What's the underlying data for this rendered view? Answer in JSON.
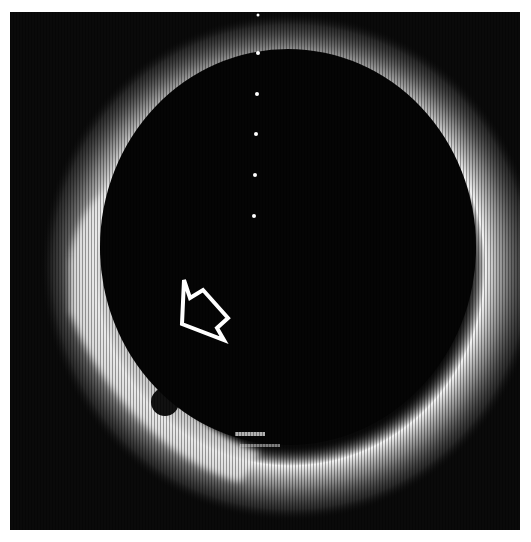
{
  "image": {
    "type": "ultrasound-scan",
    "description": "Circular ultrasound cross-section with a dark anechoic lumen surrounded by a bright echogenic ring; an outlined arrow points to a hypoechoic region at the lower-left wall",
    "annotation": {
      "kind": "outline-arrow",
      "color": "#ffffff",
      "pointing": "down-right"
    },
    "calibration_dots": 6,
    "colors": {
      "background": "#0a0a0a",
      "echo": "#ffffff",
      "border": "#ffffff"
    }
  }
}
